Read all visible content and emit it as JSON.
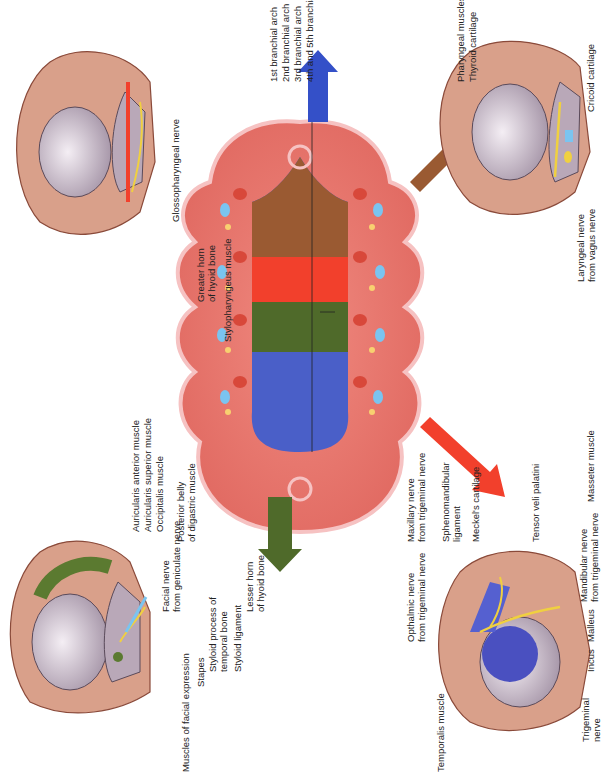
{
  "figure": {
    "central_arches": {
      "labels": [
        "1st branchial arch",
        "2nd branchial arch",
        "3rd branchial arch",
        "4th and 5th branchial arches"
      ],
      "colors": {
        "arch1": "#4a5fc8",
        "arch2": "#4f6a2a",
        "arch3": "#f2402c",
        "arch4_5": "#9a5a32",
        "embryo_body": "#e8776e",
        "embryo_outline": "#f6c2c2"
      }
    },
    "panels": {
      "first_arch": {
        "arrow_color": "#3450c8",
        "labels": {
          "temporalis": "Temporalis muscle",
          "ophthalmic_1": "Opthalmic nerve",
          "ophthalmic_2": "from trigeminal nerve",
          "maxillary_1": "Maxillary nerve",
          "maxillary_2": "from trigeminal nerve",
          "sphenomandibular_1": "Sphenomandibular",
          "sphenomandibular_2": "ligament",
          "meckel": "Meckel's cartilage",
          "tensor": "Tensor veli palatini",
          "trigeminal_1": "Trigeminal",
          "trigeminal_2": "nerve",
          "incus": "Incus",
          "malleus": "Malleus",
          "mandibular_1": "Mandibular nerve",
          "mandibular_2": "from trigeminal nerve",
          "masseter": "Masseter muscle"
        }
      },
      "second_arch": {
        "arrow_color": "#4f6a2a",
        "labels": {
          "auricularis_anterior": "Auricularis anterior muscle",
          "auricularis_superior": "Auricularis superior muscle",
          "occipitalis": "Occipitalis muscle",
          "facial_nerve_1": "Facial nerve",
          "facial_nerve_2": "from geniculate nerve",
          "posterior_belly_1": "Posterior belly",
          "posterior_belly_2": "of digastric muscle",
          "facial_expression": "Muscles of facial expression",
          "stapes": "Stapes",
          "styloid_process_1": "Styloid process of",
          "styloid_process_2": "temporal bone",
          "styloid_ligament": "Styloid ligament",
          "lesser_horn_1": "Lesser horn",
          "lesser_horn_2": "of hyoid bone"
        }
      },
      "third_arch": {
        "arrow_color": "#f2402c",
        "labels": {
          "glossopharyngeal": "Glossopharyngeal nerve",
          "greater_horn_1": "Greater horn",
          "greater_horn_2": "of hyoid bone",
          "stylopharyngeus": "Stylopharyngeus muscle"
        }
      },
      "fourth_sixth_arch": {
        "arrow_color": "#9a5a32",
        "labels": {
          "laryngeal_1": "Laryngeal nerve",
          "laryngeal_2": "from vagus nerve",
          "pharyngeal": "Pharyngeal muscles",
          "thyroid": "Thyroid cartilage",
          "cricoid": "Cricoid cartilage"
        }
      }
    },
    "colors": {
      "skin": "#d9a08a",
      "skin_outline": "#8a4a3a",
      "bone": "#b9a8b8",
      "nerve": "#f0d040",
      "muscle_green": "#5b7a30",
      "muscle_blue": "#4a50c0",
      "cartilage_blue": "#7ab8e8"
    }
  }
}
